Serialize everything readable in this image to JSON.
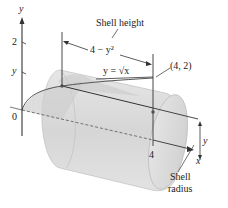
{
  "figure": {
    "axes": {
      "x_label": "x",
      "y_label": "y",
      "origin_label": "0",
      "y_tick_2": "2",
      "y_tick_y": "y",
      "x_tick_4": "4"
    },
    "curve_label": "y = √x",
    "point_label": "(4, 2)",
    "shell_height": {
      "title": "Shell height",
      "expression": "4 − y²"
    },
    "shell_radius": {
      "symbol": "y",
      "title_line1": "Shell",
      "title_line2": "radius"
    },
    "colors": {
      "cylinder_fill": "#d9d9d9",
      "cylinder_edge": "#b8b8b8",
      "region_fill": "#c8c8c8",
      "line": "#333333",
      "background": "#ffffff"
    }
  }
}
